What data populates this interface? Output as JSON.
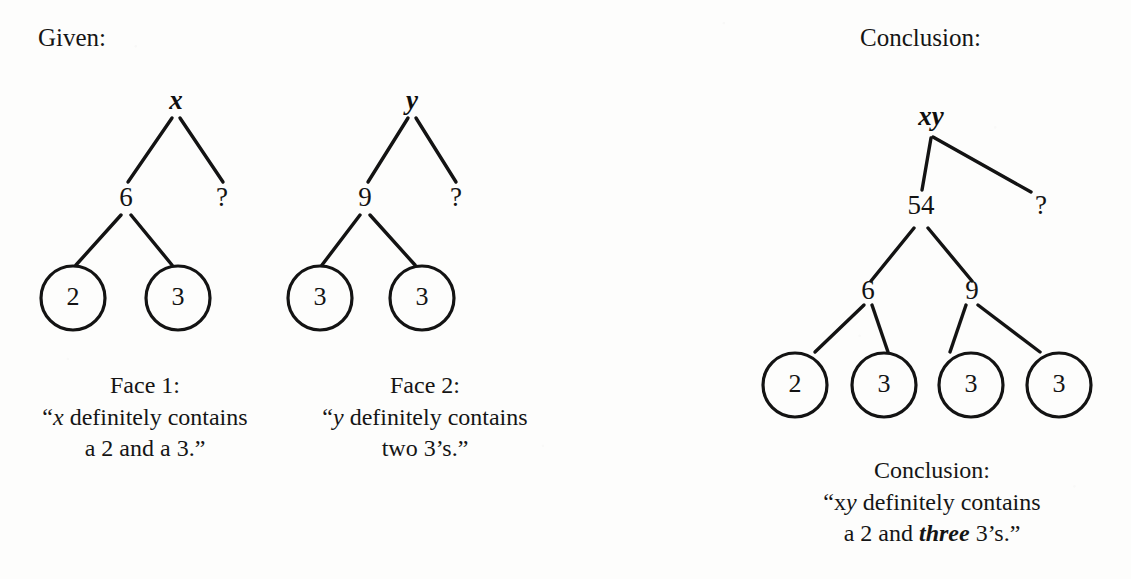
{
  "page": {
    "width": 1131,
    "height": 579,
    "background_color": "#fdfdfc",
    "ink_color": "#131313"
  },
  "labels": {
    "given": "Given:",
    "conclusion_heading": "Conclusion:"
  },
  "trees": [
    {
      "id": "tree-x",
      "root": "x",
      "root_style": "bold-italic",
      "internal_nodes": [
        {
          "label": "6"
        },
        {
          "label": "?"
        }
      ],
      "leaves": [
        {
          "label": "2",
          "circled": true
        },
        {
          "label": "3",
          "circled": true
        }
      ],
      "caption": {
        "line1": "Face 1:",
        "line2_open_quote": "“",
        "line2_italic": "x",
        "line2_rest": " definitely contains",
        "line3": "a 2 and a 3.”"
      }
    },
    {
      "id": "tree-y",
      "root": "y",
      "root_style": "bold-italic",
      "internal_nodes": [
        {
          "label": "9"
        },
        {
          "label": "?"
        }
      ],
      "leaves": [
        {
          "label": "3",
          "circled": true
        },
        {
          "label": "3",
          "circled": true
        }
      ],
      "caption": {
        "line1": "Face 2:",
        "line2_open_quote": "“",
        "line2_italic": "y",
        "line2_rest": " definitely contains",
        "line3": "two 3’s.”"
      }
    },
    {
      "id": "tree-xy",
      "root": "xy",
      "root_style": "bold-italic",
      "internal_nodes": [
        {
          "label": "54"
        },
        {
          "label": "?"
        },
        {
          "label": "6"
        },
        {
          "label": "9"
        }
      ],
      "leaves": [
        {
          "label": "2",
          "circled": true
        },
        {
          "label": "3",
          "circled": true
        },
        {
          "label": "3",
          "circled": true
        },
        {
          "label": "3",
          "circled": true
        }
      ],
      "caption": {
        "line1": "Conclusion:",
        "line2_open_quote": "“",
        "line2_plain_x": "x",
        "line2_italic_y": "y",
        "line2_rest": " definitely contains",
        "line3_pre": "a 2 and ",
        "line3_bold_italic": "three",
        "line3_post": " 3’s.”"
      }
    }
  ]
}
